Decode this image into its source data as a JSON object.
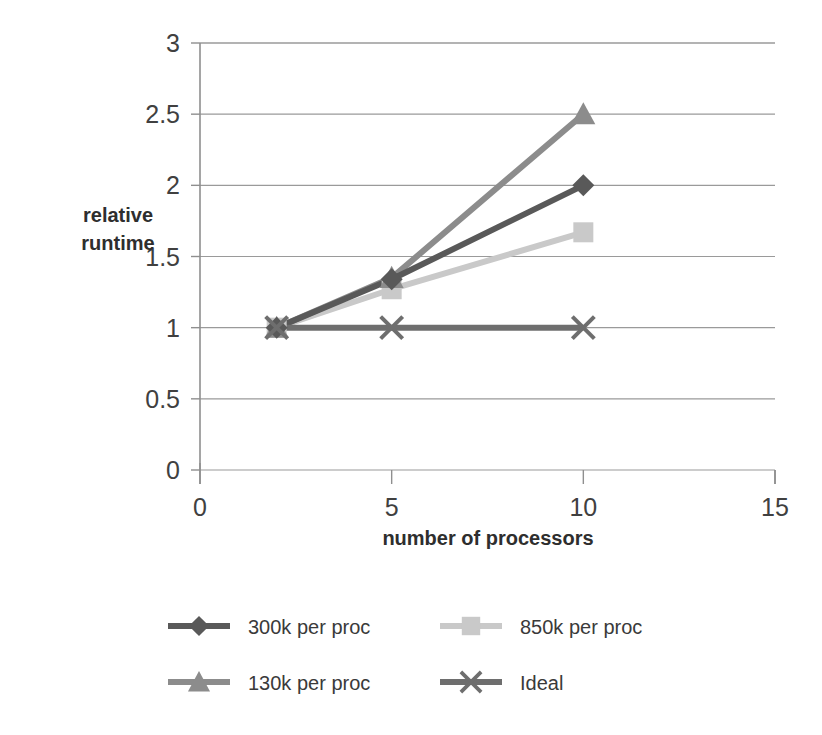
{
  "chart_data": {
    "type": "line",
    "title": "",
    "xlabel": "number of processors",
    "ylabel": "relative runtime",
    "ylabel_line1": "relative",
    "ylabel_line2": "runtime",
    "xlim": [
      0,
      15
    ],
    "ylim": [
      0,
      3
    ],
    "xticks": [
      0,
      5,
      10,
      15
    ],
    "xtick_labels": [
      "0",
      "5",
      "10",
      "15"
    ],
    "yticks": [
      0,
      0.5,
      1,
      1.5,
      2,
      2.5,
      3
    ],
    "ytick_labels": [
      "0",
      "0.5",
      "1",
      "1.5",
      "2",
      "2.5",
      "3"
    ],
    "grid": "horizontal",
    "legend_position": "bottom",
    "x": [
      2,
      5,
      10
    ],
    "series": [
      {
        "name": "300k per proc",
        "marker": "diamond",
        "color": "#595959",
        "values": [
          1.0,
          1.34,
          2.0
        ]
      },
      {
        "name": "850k per proc",
        "marker": "square",
        "color": "#c9c9c9",
        "values": [
          1.0,
          1.27,
          1.67
        ]
      },
      {
        "name": "130k per proc",
        "marker": "triangle",
        "color": "#8c8c8c",
        "values": [
          1.0,
          1.35,
          2.5
        ]
      },
      {
        "name": "Ideal",
        "marker": "x",
        "color": "#6e6e6e",
        "values": [
          1.0,
          1.0,
          1.0
        ]
      }
    ]
  },
  "legend": {
    "entries": [
      {
        "label": "300k per proc",
        "marker": "diamond",
        "color": "#595959"
      },
      {
        "label": "850k per proc",
        "marker": "square",
        "color": "#c9c9c9"
      },
      {
        "label": "130k per proc",
        "marker": "triangle",
        "color": "#8c8c8c"
      },
      {
        "label": "Ideal",
        "marker": "x",
        "color": "#6e6e6e"
      }
    ]
  },
  "colors": {
    "grid": "#9a9a9a",
    "axis": "#8f8f8f",
    "text": "#3a3a3a",
    "background": "#ffffff"
  }
}
